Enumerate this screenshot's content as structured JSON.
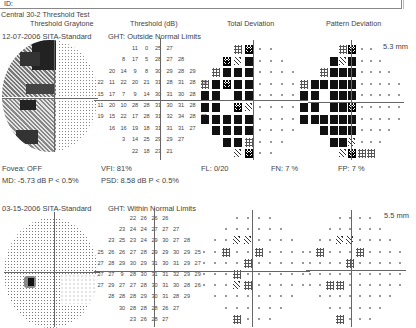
{
  "report": {
    "id_label": "ID:",
    "test_name": "Central 30-2 Threshold Test",
    "columns": [
      "Threshold Graytone",
      "Threshold (dB)",
      "Total Deviation",
      "Pattern Deviation"
    ]
  },
  "exams": [
    {
      "date_strategy": "12-07-2006 SITA-Standard",
      "ght": "GHT: Outside Normal Limits",
      "pupil": "5.3 mm",
      "fovea": "Fovea: OFF",
      "md": "MD:  -5.73 dB  P < 0.5%",
      "vfi": "VFI:  81%",
      "psd": "PSD:  8.58 dB  P < 0.5%",
      "fl": "FL: 0/20",
      "fn": "FN:  7 %",
      "fp": "FP:  7 %",
      "threshold_rows": [
        [
          "",
          "",
          "",
          "11",
          "0",
          "25",
          "27",
          "",
          "",
          ""
        ],
        [
          "",
          "",
          "8",
          "17",
          "5",
          "28",
          "27",
          "28",
          "",
          ""
        ],
        [
          "",
          "20",
          "14",
          "9",
          "8",
          "30",
          "29",
          "28",
          "29",
          ""
        ],
        [
          "22",
          "11",
          "22",
          "20",
          "21",
          "31",
          "28",
          "31",
          "28",
          "28"
        ],
        [
          "15",
          "17",
          "7",
          "9",
          "14",
          "30",
          "31",
          "30",
          "28",
          "28"
        ],
        [
          "11",
          "20",
          "10",
          "28",
          "28",
          "31",
          "30",
          "31",
          "28",
          "28"
        ],
        [
          "19",
          "15",
          "22",
          "17",
          "28",
          "31",
          "32",
          "34",
          "28",
          "25"
        ],
        [
          "",
          "16",
          "16",
          "19",
          "18",
          "31",
          "31",
          "31",
          "27",
          ""
        ],
        [
          "",
          "",
          "3",
          "14",
          "25",
          "29",
          "29",
          "27",
          "",
          ""
        ],
        [
          "",
          "",
          "",
          "22",
          "18",
          "23",
          "21",
          "",
          "",
          ""
        ]
      ],
      "total_dev_rows": [
        [
          "",
          "",
          "",
          "d",
          "x",
          "p",
          "p",
          "",
          "",
          ""
        ],
        [
          "",
          "",
          "x",
          "c",
          "b",
          "p",
          "p",
          "p",
          "",
          ""
        ],
        [
          "",
          "d",
          "b",
          "b",
          "b",
          "p",
          "p",
          "p",
          "p",
          ""
        ],
        [
          "d",
          "b",
          "x",
          "b",
          "b",
          "p",
          "p",
          "p",
          "p",
          "d"
        ],
        [
          "b",
          "b",
          "",
          "b",
          "b",
          "p",
          "p",
          "p",
          "p",
          "b"
        ],
        [
          "b",
          "b",
          "",
          "x",
          "c",
          "p",
          "p",
          "p",
          "p",
          "b"
        ],
        [
          "b",
          "b",
          "b",
          "b",
          "b",
          "p",
          "p",
          "p",
          "p",
          "b"
        ],
        [
          "",
          "b",
          "b",
          "b",
          "b",
          "p",
          "p",
          "p",
          "p",
          ""
        ],
        [
          "",
          "",
          "b",
          "b",
          "d",
          "p",
          "p",
          "p",
          "",
          ""
        ],
        [
          "",
          "",
          "",
          "c",
          "x",
          "p",
          "p",
          "",
          "",
          ""
        ]
      ],
      "pattern_dev_rows": [
        [
          "",
          "",
          "",
          "d",
          "x",
          "p",
          "p",
          "",
          "",
          ""
        ],
        [
          "",
          "",
          "b",
          "c",
          "b",
          "p",
          "p",
          "p",
          "",
          ""
        ],
        [
          "",
          "d",
          "b",
          "b",
          "b",
          "p",
          "p",
          "p",
          "p",
          ""
        ],
        [
          "b",
          "b",
          "b",
          "b",
          "b",
          "p",
          "p",
          "p",
          "p",
          "p"
        ],
        [
          "b",
          "",
          "b",
          "b",
          "b",
          "p",
          "p",
          "p",
          "p",
          "p"
        ],
        [
          "b",
          "",
          "b",
          "b",
          "x",
          "p",
          "p",
          "p",
          "p",
          "p"
        ],
        [
          "b",
          "b",
          "b",
          "b",
          "b",
          "p",
          "p",
          "p",
          "p",
          "p"
        ],
        [
          "",
          "b",
          "b",
          "b",
          "b",
          "p",
          "p",
          "p",
          "p",
          ""
        ],
        [
          "",
          "",
          "b",
          "b",
          "c",
          "p",
          "p",
          "p",
          "",
          ""
        ],
        [
          "",
          "",
          "",
          "c",
          "x",
          "d",
          "d",
          "",
          "",
          ""
        ]
      ]
    },
    {
      "date_strategy": "03-15-2006 SITA-Standard",
      "ght": "GHT: Within Normal Limits",
      "pupil": "5.5 mm",
      "threshold_rows": [
        [
          "",
          "",
          "",
          "22",
          "26",
          "26",
          "26",
          "",
          "",
          ""
        ],
        [
          "",
          "",
          "23",
          "24",
          "24",
          "27",
          "27",
          "27",
          "",
          ""
        ],
        [
          "",
          "23",
          "25",
          "23",
          "24",
          "29",
          "30",
          "27",
          "28",
          ""
        ],
        [
          "25",
          "26",
          "26",
          "27",
          "28",
          "29",
          "29",
          "30",
          "29",
          "25"
        ],
        [
          "27",
          "28",
          "29",
          "30",
          "29",
          "31",
          "30",
          "31",
          "29",
          "27"
        ],
        [
          "27",
          "27",
          "9",
          "28",
          "30",
          "31",
          "31",
          "32",
          "29",
          "29"
        ],
        [
          "27",
          "29",
          "27",
          "27",
          "28",
          "30",
          "31",
          "30",
          "28",
          "26"
        ],
        [
          "",
          "28",
          "28",
          "28",
          "29",
          "30",
          "31",
          "28",
          "29",
          ""
        ],
        [
          "",
          "",
          "30",
          "28",
          "28",
          "28",
          "26",
          "27",
          "",
          ""
        ],
        [
          "",
          "",
          "",
          "23",
          "26",
          "28",
          "27",
          "",
          "",
          ""
        ]
      ],
      "total_dev_rows": [
        [
          "",
          "",
          "",
          "p",
          "p",
          "p",
          "p",
          "",
          "",
          ""
        ],
        [
          "",
          "",
          "p",
          "p",
          "p",
          "p",
          "p",
          "p",
          "",
          ""
        ],
        [
          "",
          "p",
          "p",
          "c",
          "c",
          "p",
          "p",
          "p",
          "p",
          ""
        ],
        [
          "p",
          "p",
          "d",
          "p",
          "p",
          "d",
          "p",
          "p",
          "p",
          "p"
        ],
        [
          "p",
          "p",
          "p",
          "p",
          "d",
          "p",
          "p",
          "p",
          "p",
          "p"
        ],
        [
          "p",
          "p",
          "p",
          "d",
          "p",
          "p",
          "p",
          "p",
          "p",
          "p"
        ],
        [
          "p",
          "p",
          "p",
          "c",
          "d",
          "p",
          "p",
          "p",
          "p",
          "p"
        ],
        [
          "",
          "p",
          "p",
          "p",
          "p",
          "p",
          "p",
          "p",
          "p",
          ""
        ],
        [
          "",
          "",
          "p",
          "p",
          "p",
          "p",
          "p",
          "p",
          "",
          ""
        ],
        [
          "",
          "",
          "",
          "d",
          "p",
          "p",
          "p",
          "",
          "",
          ""
        ]
      ],
      "pattern_dev_rows": [
        [
          "",
          "",
          "",
          "p",
          "p",
          "p",
          "p",
          "",
          "",
          ""
        ],
        [
          "",
          "",
          "p",
          "p",
          "p",
          "p",
          "p",
          "p",
          "",
          ""
        ],
        [
          "",
          "p",
          "p",
          "c",
          "c",
          "p",
          "p",
          "p",
          "p",
          ""
        ],
        [
          "p",
          "d",
          "p",
          "p",
          "p",
          "d",
          "p",
          "p",
          "p",
          "p"
        ],
        [
          "p",
          "p",
          "p",
          "p",
          "d",
          "p",
          "p",
          "p",
          "p",
          "p"
        ],
        [
          "p",
          "p",
          "p",
          "p",
          "p",
          "p",
          "p",
          "p",
          "p",
          "p"
        ],
        [
          "p",
          "p",
          "d",
          "d",
          "p",
          "p",
          "p",
          "p",
          "p",
          "p"
        ],
        [
          "",
          "p",
          "p",
          "p",
          "p",
          "p",
          "p",
          "p",
          "p",
          ""
        ],
        [
          "",
          "",
          "p",
          "p",
          "p",
          "p",
          "p",
          "p",
          "",
          ""
        ],
        [
          "",
          "",
          "",
          "d",
          "p",
          "p",
          "p",
          "",
          "",
          ""
        ]
      ]
    }
  ],
  "symbol_legend": {
    "p": "normal-point-icon",
    "d": "p5-dots-icon",
    "c": "p2-hatch-icon",
    "x": "p1-checker-icon",
    "b": "p05-solid-icon"
  }
}
